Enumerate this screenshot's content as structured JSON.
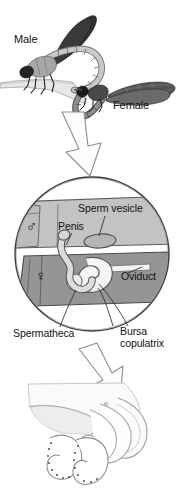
{
  "figure": {
    "background_color": "#ffffff",
    "width": 180,
    "height": 493
  },
  "palette": {
    "ink": "#111111",
    "outline": "#5a5a5a",
    "male_fill": "#c0c0c0",
    "female_fill": "#9a9a9a",
    "pale_fill": "#eeeeee",
    "wing_dark": "#3a3a3a",
    "wing_mid": "#6e6e6e",
    "body_gray": "#8d8d8d",
    "arrow_fill": "#fdfdfd",
    "arrow_stroke": "#8a8a8a"
  },
  "panels": [
    {
      "id": "panel-mating-pair",
      "name": "mating-damselflies",
      "labels": [
        {
          "key": "male",
          "text": "Male"
        },
        {
          "key": "female",
          "text": "Female"
        }
      ]
    },
    {
      "id": "panel-genitalia-circle",
      "name": "genitalia-closeup-circle",
      "symbols": [
        {
          "key": "male-symbol",
          "glyph": "♂",
          "meaning": "male"
        },
        {
          "key": "female-symbol",
          "glyph": "♀",
          "meaning": "female"
        }
      ],
      "labels": [
        {
          "key": "sperm_vesicle",
          "text": "Sperm vesicle"
        },
        {
          "key": "penis",
          "text": "Penis"
        },
        {
          "key": "oviduct",
          "text": "Oviduct"
        },
        {
          "key": "spermatheca",
          "text": "Spermatheca"
        },
        {
          "key": "bursa_line1",
          "text": "Bursa"
        },
        {
          "key": "bursa_line2",
          "text": "copulatrix"
        }
      ]
    },
    {
      "id": "panel-penis-detail",
      "name": "penis-hooks-detail",
      "labels": []
    }
  ],
  "arrows": [
    {
      "key": "arrow-top",
      "direction": "down",
      "style": "hollow-outline"
    },
    {
      "key": "arrow-bottom",
      "direction": "down-right",
      "style": "hollow-outline"
    }
  ],
  "text": {
    "male": "Male",
    "female": "Female",
    "sperm_vesicle": "Sperm vesicle",
    "penis": "Penis",
    "oviduct": "Oviduct",
    "spermatheca": "Spermatheca",
    "bursa_line1": "Bursa",
    "bursa_line2": "copulatrix",
    "male_symbol": "♂",
    "female_symbol": "♀"
  }
}
